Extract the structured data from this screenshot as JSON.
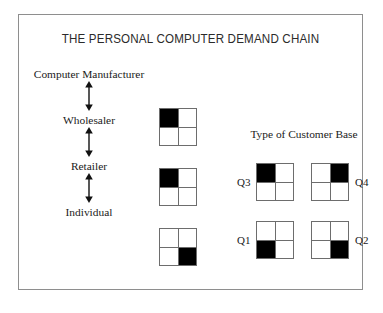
{
  "figure": {
    "title": "THE PERSONAL COMPUTER DEMAND CHAIN",
    "border_color": "#8e8e8e",
    "background_color": "#ffffff",
    "fill_color": "#000000",
    "grid_line_color": "#6d6d6d"
  },
  "chain": {
    "levels": [
      {
        "label": "Computer Manufacturer"
      },
      {
        "label": "Wholesaler"
      },
      {
        "label": "Retailer"
      },
      {
        "label": "Individual"
      }
    ],
    "arrow_glyph": "double-headed-vertical-arrow",
    "boxes": [
      {
        "name": "wholesaler-quadrant",
        "filled_quadrant": "Q3",
        "cells": [
          {
            "pos": "top-left",
            "filled": true
          },
          {
            "pos": "top-right",
            "filled": false
          },
          {
            "pos": "bottom-left",
            "filled": false
          },
          {
            "pos": "bottom-right",
            "filled": false
          }
        ]
      },
      {
        "name": "retailer-quadrant",
        "filled_quadrant": "Q3",
        "cells": [
          {
            "pos": "top-left",
            "filled": true
          },
          {
            "pos": "top-right",
            "filled": false
          },
          {
            "pos": "bottom-left",
            "filled": false
          },
          {
            "pos": "bottom-right",
            "filled": false
          }
        ]
      },
      {
        "name": "individual-quadrant",
        "filled_quadrant": "Q2",
        "cells": [
          {
            "pos": "top-left",
            "filled": false
          },
          {
            "pos": "top-right",
            "filled": false
          },
          {
            "pos": "bottom-left",
            "filled": false
          },
          {
            "pos": "bottom-right",
            "filled": true
          }
        ]
      }
    ]
  },
  "legend": {
    "title": "Type of Customer Base",
    "quadrants": [
      {
        "label": "Q3",
        "label_side": "left",
        "cells": [
          {
            "pos": "top-left",
            "filled": true
          },
          {
            "pos": "top-right",
            "filled": false
          },
          {
            "pos": "bottom-left",
            "filled": false
          },
          {
            "pos": "bottom-right",
            "filled": false
          }
        ]
      },
      {
        "label": "Q4",
        "label_side": "right",
        "cells": [
          {
            "pos": "top-left",
            "filled": false
          },
          {
            "pos": "top-right",
            "filled": true
          },
          {
            "pos": "bottom-left",
            "filled": false
          },
          {
            "pos": "bottom-right",
            "filled": false
          }
        ]
      },
      {
        "label": "Q1",
        "label_side": "left",
        "cells": [
          {
            "pos": "top-left",
            "filled": false
          },
          {
            "pos": "top-right",
            "filled": false
          },
          {
            "pos": "bottom-left",
            "filled": true
          },
          {
            "pos": "bottom-right",
            "filled": false
          }
        ]
      },
      {
        "label": "Q2",
        "label_side": "right",
        "cells": [
          {
            "pos": "top-left",
            "filled": false
          },
          {
            "pos": "top-right",
            "filled": false
          },
          {
            "pos": "bottom-left",
            "filled": false
          },
          {
            "pos": "bottom-right",
            "filled": true
          }
        ]
      }
    ]
  }
}
